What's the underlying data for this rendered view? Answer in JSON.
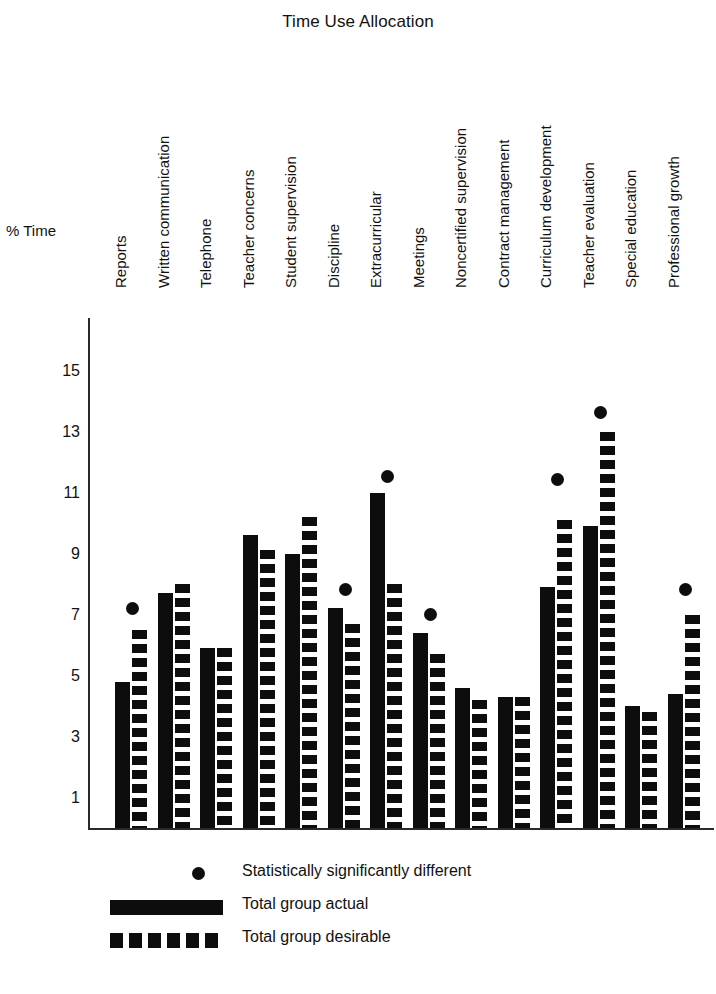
{
  "chart_data": {
    "type": "bar",
    "title": "Time Use Allocation",
    "xlabel": "",
    "ylabel": "% Time",
    "ylim": [
      0,
      15
    ],
    "yticks": [
      15,
      13,
      11,
      9,
      7,
      5,
      3,
      1
    ],
    "grid": false,
    "legend_position": "bottom-left",
    "categories": [
      "Reports",
      "Written communication",
      "Telephone",
      "Teacher concerns",
      "Student supervision",
      "Discipline",
      "Extracurricular",
      "Meetings",
      "Noncertified supervision",
      "Contract management",
      "Curriculum development",
      "Teacher evaluation",
      "Special education",
      "Professional growth"
    ],
    "series": [
      {
        "name": "Total group actual",
        "style": "solid",
        "values": [
          4.8,
          7.7,
          5.9,
          9.6,
          9.0,
          7.2,
          11.0,
          6.4,
          4.6,
          4.3,
          7.9,
          9.9,
          4.0,
          4.4
        ]
      },
      {
        "name": "Total group desirable",
        "style": "dashed",
        "values": [
          6.5,
          8.0,
          5.9,
          9.1,
          10.2,
          6.7,
          8.0,
          5.7,
          4.2,
          4.3,
          10.1,
          13.0,
          3.8,
          7.0
        ]
      }
    ],
    "significance_marker": {
      "name": "Statistically significantly different",
      "style": "dot",
      "categories": [
        "Reports",
        "Discipline",
        "Extracurricular",
        "Meetings",
        "Curriculum development",
        "Teacher evaluation",
        "Professional growth"
      ],
      "values": [
        7.0,
        7.6,
        11.3,
        6.8,
        11.2,
        13.4,
        7.6
      ]
    },
    "legend": [
      {
        "label": "Statistically significantly different",
        "key": "dot"
      },
      {
        "label": "Total group actual",
        "key": "solid"
      },
      {
        "label": "Total group desirable",
        "key": "dashed"
      }
    ]
  },
  "colors": {
    "ink": "#0d0d0d",
    "axis": "#2a2a2a",
    "background": "#ffffff"
  }
}
